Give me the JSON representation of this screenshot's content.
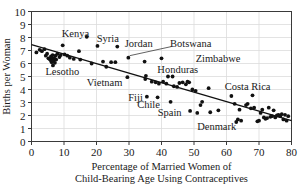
{
  "chart_data": {
    "type": "scatter",
    "title": "",
    "xlabel": "Percentage of Married Women of Child-Bearing Age Using Contraceptives",
    "xlabel_line1": "Percentage of Married Women of",
    "xlabel_line2": "Child-Bearing Age Using Contraceptives",
    "ylabel": "Births per Woman",
    "xlim": [
      0,
      80
    ],
    "ylim": [
      0,
      10
    ],
    "xticks": [
      0,
      10,
      20,
      30,
      40,
      50,
      60,
      70,
      80
    ],
    "yticks": [
      0,
      1,
      2,
      3,
      4,
      5,
      6,
      7,
      8,
      9,
      10
    ],
    "grid": "vertical-and-horizontal-faint",
    "legend": "none",
    "point_color": "#111111",
    "trendline_color": "#111111",
    "trendline": {
      "x_start": 0,
      "y_start": 7.45,
      "x_end": 80,
      "y_end": 1.6
    },
    "points": [
      {
        "x": 1.5,
        "y": 6.85
      },
      {
        "x": 2.5,
        "y": 7.05
      },
      {
        "x": 3.2,
        "y": 6.95
      },
      {
        "x": 4.0,
        "y": 7.1
      },
      {
        "x": 4.4,
        "y": 6.6
      },
      {
        "x": 4.8,
        "y": 6.75
      },
      {
        "x": 5.2,
        "y": 6.4
      },
      {
        "x": 5.6,
        "y": 6.35
      },
      {
        "x": 5.9,
        "y": 6.25
      },
      {
        "x": 6.0,
        "y": 6.55
      },
      {
        "x": 6.2,
        "y": 6.1
      },
      {
        "x": 6.3,
        "y": 6.45
      },
      {
        "x": 6.4,
        "y": 6.3
      },
      {
        "x": 6.5,
        "y": 6.65
      },
      {
        "x": 6.6,
        "y": 5.85
      },
      {
        "x": 6.8,
        "y": 6.2
      },
      {
        "x": 7.0,
        "y": 6.4
      },
      {
        "x": 7.2,
        "y": 6.05
      },
      {
        "x": 7.4,
        "y": 6.6
      },
      {
        "x": 7.6,
        "y": 6.3
      },
      {
        "x": 8.0,
        "y": 6.75
      },
      {
        "x": 8.6,
        "y": 6.5
      },
      {
        "x": 9.0,
        "y": 6.65
      },
      {
        "x": 9.6,
        "y": 7.4
      },
      {
        "x": 10.2,
        "y": 6.7
      },
      {
        "x": 11.0,
        "y": 6.6
      },
      {
        "x": 11.8,
        "y": 6.45
      },
      {
        "x": 13.0,
        "y": 6.35
      },
      {
        "x": 14.6,
        "y": 6.95
      },
      {
        "x": 15.0,
        "y": 6.3
      },
      {
        "x": 17.0,
        "y": 8.05
      },
      {
        "x": 18.5,
        "y": 6.0
      },
      {
        "x": 20.3,
        "y": 7.35
      },
      {
        "x": 22.0,
        "y": 6.15
      },
      {
        "x": 23.0,
        "y": 5.75
      },
      {
        "x": 24.5,
        "y": 6.1
      },
      {
        "x": 25.8,
        "y": 6.1
      },
      {
        "x": 26.4,
        "y": 7.3
      },
      {
        "x": 29.5,
        "y": 4.95
      },
      {
        "x": 29.8,
        "y": 6.45
      },
      {
        "x": 34.8,
        "y": 6.15
      },
      {
        "x": 35.0,
        "y": 4.8
      },
      {
        "x": 35.2,
        "y": 5.05
      },
      {
        "x": 35.5,
        "y": 3.45
      },
      {
        "x": 37.0,
        "y": 4.6
      },
      {
        "x": 38.2,
        "y": 4.55
      },
      {
        "x": 38.8,
        "y": 3.4
      },
      {
        "x": 39.2,
        "y": 4.45
      },
      {
        "x": 40.0,
        "y": 6.4
      },
      {
        "x": 40.5,
        "y": 4.6
      },
      {
        "x": 41.5,
        "y": 4.45
      },
      {
        "x": 42.0,
        "y": 5.0
      },
      {
        "x": 42.8,
        "y": 3.05
      },
      {
        "x": 43.4,
        "y": 5.0
      },
      {
        "x": 43.8,
        "y": 4.25
      },
      {
        "x": 44.8,
        "y": 4.2
      },
      {
        "x": 45.5,
        "y": 4.5
      },
      {
        "x": 46.5,
        "y": 4.55
      },
      {
        "x": 47.5,
        "y": 4.4
      },
      {
        "x": 48.0,
        "y": 4.6
      },
      {
        "x": 48.5,
        "y": 4.55
      },
      {
        "x": 48.8,
        "y": 2.35
      },
      {
        "x": 49.5,
        "y": 4.0
      },
      {
        "x": 50.5,
        "y": 3.9
      },
      {
        "x": 51.0,
        "y": 2.2
      },
      {
        "x": 52.0,
        "y": 2.8
      },
      {
        "x": 52.5,
        "y": 3.05
      },
      {
        "x": 54.5,
        "y": 4.1
      },
      {
        "x": 55.0,
        "y": 2.25
      },
      {
        "x": 57.5,
        "y": 2.4
      },
      {
        "x": 61.5,
        "y": 3.5
      },
      {
        "x": 62.5,
        "y": 2.9
      },
      {
        "x": 63.0,
        "y": 1.5
      },
      {
        "x": 63.5,
        "y": 1.7
      },
      {
        "x": 64.0,
        "y": 2.45
      },
      {
        "x": 64.5,
        "y": 1.6
      },
      {
        "x": 66.0,
        "y": 2.8
      },
      {
        "x": 66.5,
        "y": 2.9
      },
      {
        "x": 67.5,
        "y": 2.55
      },
      {
        "x": 68.0,
        "y": 3.55
      },
      {
        "x": 68.5,
        "y": 2.6
      },
      {
        "x": 69.5,
        "y": 1.55
      },
      {
        "x": 70.0,
        "y": 1.6
      },
      {
        "x": 70.5,
        "y": 2.2
      },
      {
        "x": 71.0,
        "y": 2.45
      },
      {
        "x": 71.5,
        "y": 1.85
      },
      {
        "x": 72.0,
        "y": 1.75
      },
      {
        "x": 72.5,
        "y": 1.8
      },
      {
        "x": 73.0,
        "y": 2.6
      },
      {
        "x": 73.5,
        "y": 1.9
      },
      {
        "x": 74.0,
        "y": 1.95
      },
      {
        "x": 74.5,
        "y": 2.4
      },
      {
        "x": 75.0,
        "y": 1.85
      },
      {
        "x": 75.5,
        "y": 2.0
      },
      {
        "x": 76.0,
        "y": 2.05
      },
      {
        "x": 76.5,
        "y": 1.95
      },
      {
        "x": 77.0,
        "y": 2.1
      },
      {
        "x": 77.5,
        "y": 1.7
      },
      {
        "x": 78.0,
        "y": 2.05
      },
      {
        "x": 78.5,
        "y": 1.6
      },
      {
        "x": 79.0,
        "y": 1.95
      }
    ],
    "annotations": [
      {
        "label": "Kenya",
        "x": 13.5,
        "y": 8.35,
        "anchor": "middle",
        "leader": null
      },
      {
        "label": "Syria",
        "x": 23.5,
        "y": 8.0,
        "anchor": "middle",
        "leader": null
      },
      {
        "label": "Jordan",
        "x": 33.0,
        "y": 7.55,
        "anchor": "middle",
        "leader": null
      },
      {
        "label": "Botswana",
        "x": 49.0,
        "y": 7.55,
        "anchor": "middle",
        "leader": {
          "x1": 43.0,
          "y1": 7.3,
          "x2": 30.2,
          "y2": 6.6
        }
      },
      {
        "label": "Zimbabwe",
        "x": 50.5,
        "y": 6.4,
        "anchor": "start",
        "leader": null
      },
      {
        "label": "Honduras",
        "x": 45.0,
        "y": 5.6,
        "anchor": "middle",
        "leader": null
      },
      {
        "label": "Lesotho",
        "x": 9.5,
        "y": 5.45,
        "anchor": "middle",
        "leader": null
      },
      {
        "label": "Vietnam",
        "x": 22.5,
        "y": 4.6,
        "anchor": "middle",
        "leader": null
      },
      {
        "label": "Costa Rica",
        "x": 66.5,
        "y": 4.3,
        "anchor": "middle",
        "leader": null
      },
      {
        "label": "Fiji",
        "x": 32.0,
        "y": 3.45,
        "anchor": "middle",
        "leader": null
      },
      {
        "label": "Chile",
        "x": 36.0,
        "y": 2.9,
        "anchor": "middle",
        "leader": null
      },
      {
        "label": "Spain",
        "x": 42.5,
        "y": 2.25,
        "anchor": "middle",
        "leader": null
      },
      {
        "label": "Denmark",
        "x": 57.0,
        "y": 1.2,
        "anchor": "middle",
        "leader": null
      }
    ]
  }
}
